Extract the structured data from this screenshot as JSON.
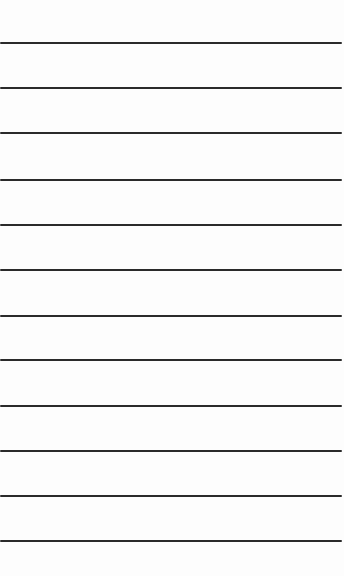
{
  "page": {
    "type": "ruled-paper",
    "background": "#fdfdfd",
    "line_color": "#2a2a2a",
    "lines": [
      43,
      88,
      133,
      180,
      225,
      270,
      316,
      360,
      406,
      451,
      496,
      541
    ]
  }
}
